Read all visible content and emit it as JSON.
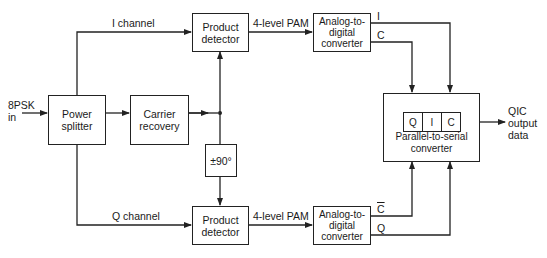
{
  "diagram": {
    "input": {
      "line1": "8PSK",
      "line2": "in"
    },
    "output": {
      "line1": "QIC",
      "line2": "output",
      "line3": "data"
    },
    "blocks": {
      "power_splitter": {
        "line1": "Power",
        "line2": "splitter"
      },
      "carrier_recovery": {
        "line1": "Carrier",
        "line2": "recovery"
      },
      "product_detector_i": {
        "line1": "Product",
        "line2": "detector"
      },
      "product_detector_q": {
        "line1": "Product",
        "line2": "detector"
      },
      "phase_shifter": {
        "label": "±90°"
      },
      "adc_i": {
        "line1": "Analog-to-",
        "line2": "digital",
        "line3": "converter"
      },
      "adc_q": {
        "line1": "Analog-to-",
        "line2": "digital",
        "line3": "converter"
      },
      "parallel_to_serial": {
        "line1": "Parallel-to-serial",
        "line2": "converter",
        "cells": [
          "Q",
          "I",
          "C"
        ]
      }
    },
    "edges": {
      "i_channel": "I channel",
      "q_channel": "Q channel",
      "pam_i": "4-level PAM",
      "pam_q": "4-level PAM",
      "adc_i_out_i": "I",
      "adc_i_out_c": "C",
      "adc_q_out_cbar": "C",
      "adc_q_out_q": "Q"
    }
  }
}
